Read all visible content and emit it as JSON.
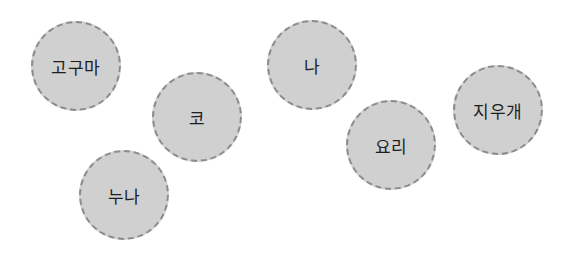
{
  "colors": {
    "background": "#ffffff",
    "bubble_fill": "#d0d0d0",
    "bubble_border": "#8c8c8c",
    "text": "#1e1e1e"
  },
  "bubbles": [
    {
      "label": "고구마",
      "cx": 77,
      "cy": 67
    },
    {
      "label": "코",
      "cx": 198,
      "cy": 118
    },
    {
      "label": "누나",
      "cx": 125,
      "cy": 196
    },
    {
      "label": "나",
      "cx": 313,
      "cy": 66
    },
    {
      "label": "요리",
      "cx": 392,
      "cy": 146
    },
    {
      "label": "지우개",
      "cx": 499,
      "cy": 111
    }
  ]
}
